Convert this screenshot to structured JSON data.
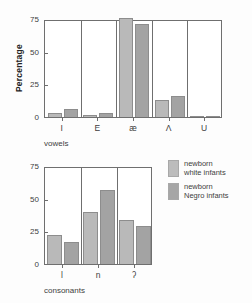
{
  "legend": {
    "entries": [
      {
        "label": "newborn\nwhite infants",
        "color": "#bcbcbc",
        "key": "white"
      },
      {
        "label": "newborn\nNegro infants",
        "color": "#a6a6a6",
        "key": "negro"
      }
    ]
  },
  "chart_data": [
    {
      "type": "bar",
      "id": "vowels",
      "title": "",
      "xlabel": "vowels",
      "ylabel": "Percentage",
      "categories": [
        "I",
        "E",
        "æ",
        "Λ",
        "U"
      ],
      "ylim": [
        0,
        75
      ],
      "yticks": [
        0,
        25,
        50,
        75
      ],
      "grid": false,
      "legend_position": "right",
      "series": [
        {
          "name": "newborn white infants",
          "values": [
            3,
            1.5,
            76,
            13,
            0.3
          ]
        },
        {
          "name": "newborn Negro infants",
          "values": [
            6,
            3,
            71,
            16,
            1
          ]
        }
      ]
    },
    {
      "type": "bar",
      "id": "consonants",
      "title": "",
      "xlabel": "consonants",
      "ylabel": "",
      "categories": [
        "l",
        "n",
        "ʔ"
      ],
      "ylim": [
        0,
        75
      ],
      "yticks": [
        0,
        25,
        50,
        75
      ],
      "grid": false,
      "legend_position": "right",
      "series": [
        {
          "name": "newborn white infants",
          "values": [
            22,
            40,
            34
          ]
        },
        {
          "name": "newborn Negro infants",
          "values": [
            16.5,
            57,
            29
          ]
        }
      ]
    }
  ]
}
